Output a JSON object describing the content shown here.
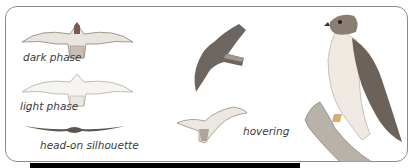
{
  "illustration": {
    "subject": "hawk plumage and flight identification plate",
    "captions": {
      "dark_phase": "dark phase",
      "light_phase": "light phase",
      "head_on": "head-on silhouette",
      "hovering": "hovering"
    },
    "colors": {
      "border": "#8a8a8a",
      "bar": "#000000",
      "caption": "#3a3a3a",
      "plumage_dark": "#5a5550",
      "plumage_mid": "#8c8580",
      "plumage_light": "#d8d4cf",
      "bark": "#9a9590"
    }
  }
}
